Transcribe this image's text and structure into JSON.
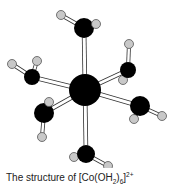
{
  "figure": {
    "caption": {
      "prefix": "The structure of [Co(OH",
      "sub1": "2",
      "mid": ")",
      "sub2": "6",
      "end": "]",
      "sup": "2+"
    },
    "colors": {
      "metal": "#000000",
      "oxygen": "#000000",
      "hydrogen": "#c8c8c8",
      "bond_fill": "#ffffff",
      "bond_outline": "#333333"
    },
    "center": {
      "label": "Co",
      "x": 85,
      "y": 90,
      "r": 16
    },
    "ligands": [
      {
        "label": "OH2",
        "o": {
          "x": 84,
          "y": 28,
          "r": 10
        },
        "h": [
          {
            "x": 61,
            "y": 15
          },
          {
            "x": 96,
            "y": 24
          }
        ]
      },
      {
        "label": "OH2",
        "o": {
          "x": 32,
          "y": 77,
          "r": 8
        },
        "h": [
          {
            "x": 12,
            "y": 64
          },
          {
            "x": 37,
            "y": 61
          }
        ]
      },
      {
        "label": "OH2",
        "o": {
          "x": 128,
          "y": 70,
          "r": 8
        },
        "h": [
          {
            "x": 129,
            "y": 44
          },
          {
            "x": 123,
            "y": 80
          }
        ]
      },
      {
        "label": "OH2",
        "o": {
          "x": 44,
          "y": 113,
          "r": 10
        },
        "h": [
          {
            "x": 49,
            "y": 102
          },
          {
            "x": 42,
            "y": 137
          }
        ]
      },
      {
        "label": "OH2",
        "o": {
          "x": 140,
          "y": 106,
          "r": 10
        },
        "h": [
          {
            "x": 134,
            "y": 119
          },
          {
            "x": 162,
            "y": 116
          }
        ]
      },
      {
        "label": "OH2",
        "o": {
          "x": 86,
          "y": 154,
          "r": 9
        },
        "h": [
          {
            "x": 74,
            "y": 157
          },
          {
            "x": 108,
            "y": 166
          }
        ]
      }
    ]
  }
}
